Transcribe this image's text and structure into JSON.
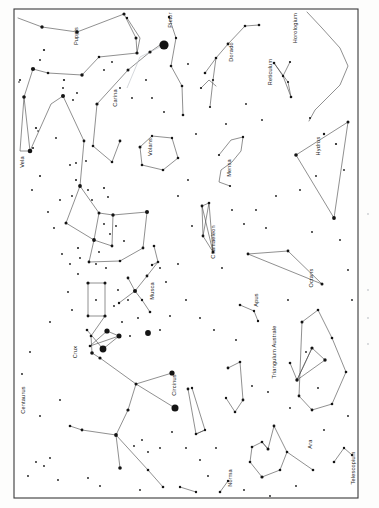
{
  "document": {
    "kind": "star-chart",
    "title": "Southern Sky Constellation Chart",
    "orientation": "landscape-rotated",
    "frame_color": "#3a3a3a",
    "star_color": "#141414",
    "line_color": "#4a4a4a",
    "background_color": "#ffffff"
  },
  "chart_data": {
    "type": "scatter",
    "xlabel": "",
    "ylabel": "",
    "grid": false,
    "legend": "none",
    "xlim": [
      0,
      379
    ],
    "ylim": [
      0,
      508
    ],
    "frame": {
      "x": 14,
      "y": 9,
      "width": 344,
      "height": 489
    },
    "label_rotation_deg": -90,
    "constellations": [
      {
        "name": "Puppis",
        "label_x": 78,
        "label_y": 36
      },
      {
        "name": "Carina",
        "label_x": 117,
        "label_y": 98
      },
      {
        "name": "Vela",
        "label_x": 24,
        "label_y": 162
      },
      {
        "name": "Pictor",
        "label_x": 172,
        "label_y": 20
      },
      {
        "name": "Volans",
        "label_x": 152,
        "label_y": 147
      },
      {
        "name": "Dorado",
        "label_x": 233,
        "label_y": 52
      },
      {
        "name": "Reticulum",
        "label_x": 272,
        "label_y": 72
      },
      {
        "name": "Horologium",
        "label_x": 297,
        "label_y": 28
      },
      {
        "name": "Hydrus",
        "label_x": 320,
        "label_y": 146
      },
      {
        "name": "Mensa",
        "label_x": 231,
        "label_y": 168
      },
      {
        "name": "Chamaeleon",
        "label_x": 215,
        "label_y": 242
      },
      {
        "name": "Musca",
        "label_x": 154,
        "label_y": 291
      },
      {
        "name": "Octans",
        "label_x": 313,
        "label_y": 278
      },
      {
        "name": "Apus",
        "label_x": 258,
        "label_y": 300
      },
      {
        "name": "Triangulum Australe",
        "label_x": 276,
        "label_y": 352
      },
      {
        "name": "Crux",
        "label_x": 77,
        "label_y": 352
      },
      {
        "name": "Centaurus",
        "label_x": 25,
        "label_y": 400
      },
      {
        "name": "Circinus",
        "label_x": 176,
        "label_y": 385
      },
      {
        "name": "Norma",
        "label_x": 232,
        "label_y": 478
      },
      {
        "name": "Ara",
        "label_x": 312,
        "label_y": 444
      },
      {
        "name": "Telescopium",
        "label_x": 355,
        "label_y": 468
      }
    ],
    "bright_stars": [
      {
        "x": 164,
        "y": 45,
        "r": 4.6
      },
      {
        "x": 103,
        "y": 349,
        "r": 3.5
      },
      {
        "x": 175,
        "y": 408,
        "r": 3.6
      },
      {
        "x": 148,
        "y": 333,
        "r": 3.0
      },
      {
        "x": 107,
        "y": 331,
        "r": 2.7
      }
    ],
    "star_count_approx": 196,
    "series": [
      {
        "name": "bright-stars",
        "marker": "filled-circle",
        "size_range_px": [
          2.4,
          4.6
        ]
      },
      {
        "name": "faint-stars",
        "marker": "filled-circle",
        "size_range_px": [
          0.7,
          2.0
        ]
      }
    ]
  },
  "labels": [
    "Puppis",
    "Carina",
    "Vela",
    "Pictor",
    "Volans",
    "Dorado",
    "Reticulum",
    "Horologium",
    "Hydrus",
    "Mensa",
    "Chamaeleon",
    "Musca",
    "Octans",
    "Apus",
    "Triangulum Australe",
    "Crux",
    "Centaurus",
    "Circinus",
    "Norma",
    "Ara",
    "Telescopium"
  ]
}
